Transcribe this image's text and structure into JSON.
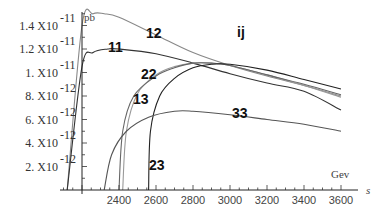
{
  "chart_data": {
    "type": "line",
    "title": "ij",
    "xlabel": "s",
    "xunit": "Gev",
    "ylabel": "pb",
    "xlim": [
      2200,
      3600
    ],
    "ylim": [
      0,
      1.5e-11
    ],
    "grid": false,
    "x_ticks": [
      "2400",
      "2600",
      "2800",
      "3000",
      "3200",
      "3400",
      "3600"
    ],
    "y_ticks": [
      {
        "mant": "2.",
        "exp": "-12",
        "value": 2e-12
      },
      {
        "mant": "4.",
        "exp": "-12",
        "value": 4e-12
      },
      {
        "mant": "6.",
        "exp": "-12",
        "value": 6e-12
      },
      {
        "mant": "8.",
        "exp": "-12",
        "value": 8e-12
      },
      {
        "mant": "1.",
        "exp": "-11",
        "value": 1e-11
      },
      {
        "mant": "1.2",
        "exp": "-11",
        "value": 1.2e-11
      },
      {
        "mant": "1.4",
        "exp": "-11",
        "value": 1.4e-11
      }
    ],
    "series": [
      {
        "name": "12",
        "color": "#888888",
        "x": [
          2120,
          2200,
          2260,
          2320,
          2400,
          2600,
          2800,
          3000,
          3200,
          3400,
          3600
        ],
        "y": [
          0,
          1.4e-11,
          1.5e-11,
          1.5e-11,
          1.47e-11,
          1.32e-11,
          1.17e-11,
          1.06e-11,
          9.7e-12,
          8.9e-12,
          8e-12
        ]
      },
      {
        "name": "11",
        "color": "#333333",
        "x": [
          2120,
          2200,
          2260,
          2340,
          2400,
          2600,
          2800,
          3000,
          3200,
          3400,
          3600
        ],
        "y": [
          0,
          1.05e-11,
          1.17e-11,
          1.2e-11,
          1.2e-11,
          1.16e-11,
          1.08e-11,
          9.9e-12,
          9.1e-12,
          8.4e-12,
          6.8e-12
        ]
      },
      {
        "name": "22",
        "color": "#999999",
        "x": [
          2420,
          2440,
          2500,
          2600,
          2700,
          2800,
          2900,
          3000,
          3200,
          3400,
          3600
        ],
        "y": [
          0,
          5e-12,
          8.2e-12,
          9.8e-12,
          1.05e-11,
          1.08e-11,
          1.08e-11,
          1.06e-11,
          9.8e-12,
          8.9e-12,
          7.9e-12
        ]
      },
      {
        "name": "13",
        "color": "#666666",
        "x": [
          2400,
          2420,
          2480,
          2600,
          2700,
          2800,
          2900,
          3000,
          3200,
          3400,
          3600
        ],
        "y": [
          0,
          5e-12,
          8e-12,
          9.7e-12,
          1.04e-11,
          1.08e-11,
          1.08e-11,
          1.06e-11,
          9.8e-12,
          9e-12,
          8.1e-12
        ]
      },
      {
        "name": "23",
        "color": "#222222",
        "x": [
          2560,
          2570,
          2620,
          2700,
          2800,
          2900,
          3000,
          3200,
          3400,
          3600
        ],
        "y": [
          0,
          5e-12,
          8e-12,
          9.5e-12,
          1.04e-11,
          1.07e-11,
          1.07e-11,
          1.02e-11,
          9.4e-12,
          8.6e-12
        ]
      },
      {
        "name": "33",
        "color": "#555555",
        "x": [
          2320,
          2360,
          2440,
          2560,
          2700,
          2800,
          3000,
          3200,
          3400,
          3600
        ],
        "y": [
          0,
          3e-12,
          5e-12,
          6.2e-12,
          6.7e-12,
          6.7e-12,
          6.4e-12,
          6e-12,
          5.6e-12,
          5e-12
        ]
      }
    ],
    "annotations": [
      {
        "text": "12",
        "x": 146,
        "y": 38
      },
      {
        "text": "11",
        "x": 108,
        "y": 52
      },
      {
        "text": "22",
        "x": 141,
        "y": 79
      },
      {
        "text": "13",
        "x": 133,
        "y": 104
      },
      {
        "text": "23",
        "x": 149,
        "y": 170
      },
      {
        "text": "33",
        "x": 232,
        "y": 118
      },
      {
        "text": "ij",
        "x": 237,
        "y": 37
      }
    ]
  }
}
